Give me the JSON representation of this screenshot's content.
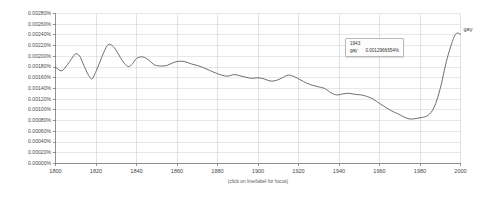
{
  "caption": "(click on line/label for focus)",
  "tooltip": {
    "year": "1943",
    "series_name": "gay",
    "value": "0.0012966654%"
  },
  "series_end_label": "gay",
  "colors": {
    "line": "#555555",
    "grid": "#d8d8d8",
    "axis": "#777777",
    "text": "#4a4a4a",
    "tooltip_bg": "#fdfdfd",
    "tooltip_border": "#b9b9b9"
  },
  "chart_data": {
    "type": "line",
    "title": "",
    "xlabel": "(click on line/label for focus)",
    "ylabel": "",
    "xlim": [
      1800,
      2000
    ],
    "ylim": [
      0.0,
      0.0028
    ],
    "grid": true,
    "legend_position": "right-end-of-line",
    "xticks": [
      1800,
      1820,
      1840,
      1860,
      1880,
      1900,
      1920,
      1940,
      1960,
      1980,
      2000
    ],
    "xtick_labels": [
      "1800",
      "1820",
      "1840",
      "1860",
      "1880",
      "1900",
      "1920",
      "1940",
      "1960",
      "1980",
      "2000"
    ],
    "yticks": [
      0.0,
      0.0002,
      0.0004,
      0.0006,
      0.0008,
      0.001,
      0.0012,
      0.0014,
      0.0016,
      0.0018,
      0.002,
      0.0022,
      0.0024,
      0.0026,
      0.0028
    ],
    "ytick_labels": [
      "0.00000%",
      "0.00020%",
      "0.00040%",
      "0.00060%",
      "0.00080%",
      "0.00100%",
      "0.00120%",
      "0.00140%",
      "0.00160%",
      "0.00180%",
      "0.00200%",
      "0.00220%",
      "0.00240%",
      "0.00260%",
      "0.00280%"
    ],
    "annotations": [
      {
        "x": 1943,
        "label": "1943",
        "series": "gay",
        "value": "0.0012966654%"
      }
    ],
    "series": [
      {
        "name": "gay",
        "x": [
          1800,
          1803,
          1806,
          1808,
          1810,
          1812,
          1814,
          1816,
          1818,
          1820,
          1822,
          1824,
          1826,
          1828,
          1830,
          1832,
          1834,
          1836,
          1838,
          1840,
          1843,
          1846,
          1849,
          1852,
          1855,
          1858,
          1861,
          1864,
          1867,
          1870,
          1873,
          1876,
          1879,
          1882,
          1885,
          1888,
          1891,
          1894,
          1897,
          1900,
          1903,
          1906,
          1909,
          1912,
          1915,
          1918,
          1921,
          1924,
          1927,
          1930,
          1933,
          1936,
          1939,
          1942,
          1945,
          1948,
          1951,
          1954,
          1957,
          1960,
          1963,
          1966,
          1969,
          1972,
          1975,
          1978,
          1981,
          1984,
          1987,
          1990,
          1993,
          1996,
          1998,
          2000
        ],
        "y": [
          0.0018,
          0.00173,
          0.00185,
          0.00196,
          0.00205,
          0.002,
          0.00183,
          0.00167,
          0.00158,
          0.00172,
          0.0019,
          0.00209,
          0.00222,
          0.0022,
          0.00211,
          0.00198,
          0.00187,
          0.00181,
          0.00186,
          0.00196,
          0.00199,
          0.00193,
          0.00184,
          0.00182,
          0.00183,
          0.00188,
          0.00191,
          0.0019,
          0.00186,
          0.00183,
          0.00179,
          0.00174,
          0.00169,
          0.00165,
          0.00163,
          0.00166,
          0.00164,
          0.00161,
          0.00159,
          0.0016,
          0.00158,
          0.00154,
          0.00155,
          0.0016,
          0.00165,
          0.00162,
          0.00156,
          0.0015,
          0.00146,
          0.00143,
          0.0014,
          0.00132,
          0.00128,
          0.0013,
          0.00131,
          0.00129,
          0.00128,
          0.00125,
          0.0012,
          0.00112,
          0.00105,
          0.00098,
          0.00093,
          0.00087,
          0.00083,
          0.00084,
          0.00086,
          0.0009,
          0.00105,
          0.0014,
          0.0019,
          0.00228,
          0.00243,
          0.00241
        ]
      }
    ]
  }
}
